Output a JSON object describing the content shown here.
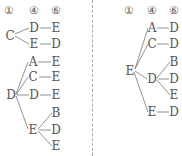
{
  "left_tree": {
    "headers": [
      "①",
      "④",
      "⑥"
    ],
    "branches": [
      {
        "root": "C",
        "children": [
          {
            "node": "D",
            "leaf": "E"
          },
          {
            "node": "E",
            "leaf": "D"
          }
        ]
      },
      {
        "root": "D",
        "children": [
          {
            "node": "A",
            "leaf": "E"
          },
          {
            "node": "C",
            "leaf": "E"
          },
          {
            "node": "D",
            "leaf": "E"
          },
          {
            "node": "E",
            "leaves": [
              "B",
              "D",
              "E"
            ]
          }
        ]
      }
    ]
  },
  "right_tree": {
    "headers": [
      "①",
      "④",
      "⑥"
    ],
    "branches": [
      {
        "root": "E",
        "children": [
          {
            "node": "A",
            "leaf": "D"
          },
          {
            "node": "C",
            "leaf": "D"
          },
          {
            "node": "D",
            "leaves": [
              "B",
              "D",
              "E"
            ]
          },
          {
            "node": "E",
            "leaf": "D"
          }
        ]
      }
    ]
  },
  "colors": {
    "text": "#555555",
    "line": "#777777",
    "divider": "#aaaaaa"
  }
}
